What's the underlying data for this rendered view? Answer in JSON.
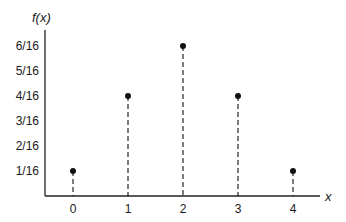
{
  "chart_data": {
    "type": "stem",
    "title": "",
    "xlabel": "x",
    "ylabel": "f(x)",
    "x": [
      0,
      1,
      2,
      3,
      4
    ],
    "values": [
      0.0625,
      0.25,
      0.375,
      0.25,
      0.0625
    ],
    "value_labels": [
      "1/16",
      "4/16",
      "6/16",
      "4/16",
      "1/16"
    ],
    "x_tick_labels": [
      "0",
      "1",
      "2",
      "3",
      "4"
    ],
    "y_tick_labels": [
      "1/16",
      "2/16",
      "3/16",
      "4/16",
      "5/16",
      "6/16"
    ],
    "y_tick_values": [
      0.0625,
      0.125,
      0.1875,
      0.25,
      0.3125,
      0.375
    ],
    "xlim": [
      -0.5,
      4.7
    ],
    "ylim": [
      0,
      0.42
    ],
    "grid": false,
    "legend": null,
    "style": {
      "marker": "filled-circle",
      "stem_line": "dashed",
      "color": "#111111"
    }
  }
}
